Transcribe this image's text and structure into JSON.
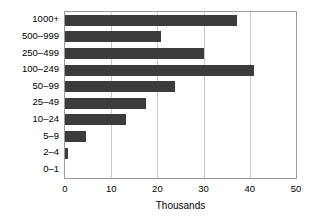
{
  "chart_data": {
    "type": "bar",
    "orientation": "horizontal",
    "title": "",
    "subtitle": "",
    "xlabel": "Thousands",
    "ylabel": "",
    "categories": [
      "0–1",
      "2–4",
      "5–9",
      "10–24",
      "25–49",
      "50–99",
      "100–249",
      "250–499",
      "500–999",
      "1000+"
    ],
    "values": [
      0.0,
      0.6,
      4.5,
      13.3,
      17.6,
      23.8,
      41.0,
      30.0,
      20.8,
      37.2
    ],
    "xlim": [
      0,
      50
    ],
    "xticks": [
      0,
      10,
      20,
      30,
      40,
      50
    ],
    "xtick_labels": [
      "0",
      "10",
      "20",
      "30",
      "40",
      "50"
    ],
    "grid": "vertical",
    "legend": "none",
    "bar_color": "#3c3c3c",
    "grid_color": "#c8c8c8",
    "frame_color": "#9a9a9a",
    "background_color": "#ffffff"
  }
}
